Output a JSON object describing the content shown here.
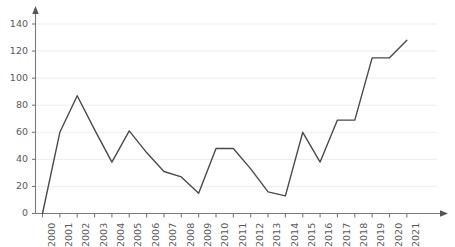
{
  "chart_data": {
    "type": "line",
    "title": "",
    "xlabel": "",
    "ylabel": "",
    "categories": [
      "2000",
      "2001",
      "2002",
      "2003",
      "2004",
      "2005",
      "2006",
      "2007",
      "2008",
      "2009",
      "2010",
      "2011",
      "2012",
      "2013",
      "2014",
      "2015",
      "2016",
      "2017",
      "2018",
      "2019",
      "2020",
      "2021"
    ],
    "values": [
      0,
      60,
      87,
      62,
      38,
      61,
      45,
      31,
      27,
      15,
      48,
      48,
      33,
      16,
      13,
      60,
      38,
      69,
      69,
      115,
      115,
      128
    ],
    "ylim": [
      0,
      140
    ],
    "yticks": [
      0,
      20,
      40,
      60,
      80,
      100,
      120,
      140
    ],
    "ytick_labels": [
      "0",
      "20",
      "40",
      "60",
      "80",
      "100",
      "120",
      "140"
    ],
    "grid": true,
    "grid_axis": "y",
    "legend": false,
    "legend_position": "none",
    "series": [
      {
        "name": "series-1",
        "values": [
          0,
          60,
          87,
          62,
          38,
          61,
          45,
          31,
          27,
          15,
          48,
          48,
          33,
          16,
          13,
          60,
          38,
          69,
          69,
          115,
          115,
          128
        ]
      }
    ],
    "colors": {
      "line": "#4a4a4a",
      "grid": "#ededed",
      "axis": "#7a7a7a",
      "tick_text": "#595959",
      "background": "#ffffff"
    },
    "axis_arrows": {
      "x_arrow_right": true,
      "y_arrow_up": true
    },
    "xtick_rotation": -90
  }
}
